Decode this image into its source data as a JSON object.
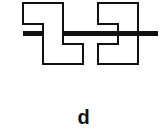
{
  "figure": {
    "label": "d",
    "colors": {
      "stroke": "#111111",
      "fill": "#ffffff",
      "bar": "#111111"
    },
    "shapes": [
      {
        "name": "left-z-shape",
        "description": "Z-shaped outline, drawn over the bar"
      },
      {
        "name": "right-notched-shape",
        "description": "Rectangle with left-side notch, under the bar"
      }
    ],
    "bar": {
      "name": "horizontal-bar"
    }
  }
}
